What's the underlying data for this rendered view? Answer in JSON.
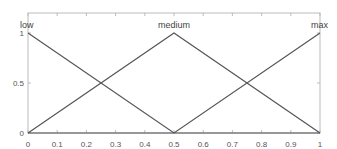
{
  "chart_data": {
    "type": "line",
    "title": "",
    "xlabel": "",
    "ylabel": "",
    "xlim": [
      0,
      1
    ],
    "ylim": [
      0,
      1
    ],
    "grid": false,
    "x_ticks": [
      "0",
      "0.1",
      "0.2",
      "0.3",
      "0.4",
      "0.5",
      "0.6",
      "0.7",
      "0.8",
      "0.9",
      "1"
    ],
    "y_ticks": [
      "0",
      "0.5",
      "1"
    ],
    "series": [
      {
        "name": "low",
        "x": [
          0,
          0.5,
          1
        ],
        "values": [
          1,
          0,
          0
        ]
      },
      {
        "name": "medium",
        "x": [
          0,
          0.5,
          1
        ],
        "values": [
          0,
          1,
          0
        ]
      },
      {
        "name": "max",
        "x": [
          0,
          0.5,
          1
        ],
        "values": [
          0,
          0,
          1
        ]
      }
    ],
    "annotations": [
      {
        "text": "low",
        "x": 0,
        "y": 1
      },
      {
        "text": "medium",
        "x": 0.5,
        "y": 1
      },
      {
        "text": "max",
        "x": 1,
        "y": 1
      }
    ],
    "colors": {
      "line": "#555555",
      "axis": "#bbbbbb",
      "text": "#555555"
    }
  }
}
